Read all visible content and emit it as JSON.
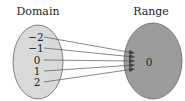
{
  "diagram": {
    "type": "function-mapping",
    "domain": {
      "title": "Domain",
      "values": [
        "−2",
        "−1",
        "0",
        "1",
        "2"
      ],
      "fill": "#d9d9d9"
    },
    "range": {
      "title": "Range",
      "values": [
        "0"
      ],
      "fill": "#9c9c9c"
    },
    "mappings": [
      {
        "from": "−2",
        "to": "0"
      },
      {
        "from": "−1",
        "to": "0"
      },
      {
        "from": "0",
        "to": "0"
      },
      {
        "from": "1",
        "to": "0"
      },
      {
        "from": "2",
        "to": "0"
      }
    ]
  }
}
